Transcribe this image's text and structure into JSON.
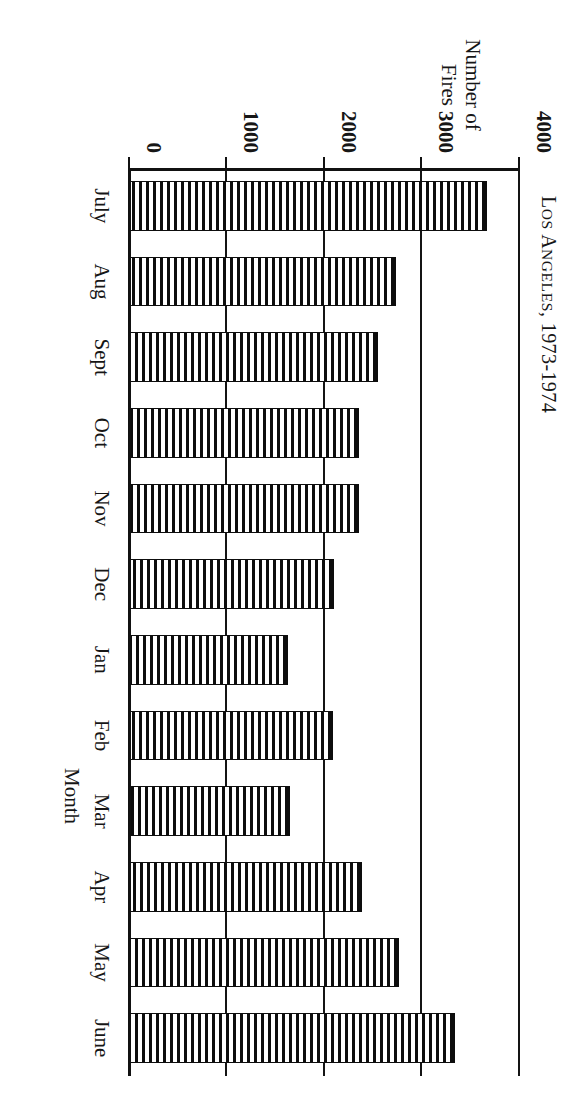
{
  "chart_data": {
    "type": "bar",
    "title": "Los Angeles, 1973-1974",
    "title_main": "L",
    "title_rest": "OS ",
    "orientation": "vertical-bars-on-rotated-page",
    "categories": [
      "July",
      "Aug",
      "Sept",
      "Oct",
      "Nov",
      "Dec",
      "Jan",
      "Feb",
      "Mar",
      "Apr",
      "May",
      "June"
    ],
    "values": [
      3680,
      2750,
      2560,
      2370,
      2370,
      2110,
      1640,
      2100,
      1660,
      2400,
      2780,
      3350
    ],
    "xlabel": "Month",
    "ylabel": "Number of\nFires",
    "ylabel_line1": "Number of",
    "ylabel_line2": "Fires",
    "ylim": [
      0,
      4000
    ],
    "yticks": [
      0,
      1000,
      2000,
      3000,
      4000
    ],
    "ytick_labels": [
      "0",
      "1000",
      "2000",
      "3000",
      "4000"
    ],
    "grid": true,
    "legend": false,
    "bar_fill": "horizontal-hatch",
    "colors": {
      "ink": "#111111",
      "paper": "#ffffff"
    }
  },
  "title": {
    "cap": "L",
    "small_a": "OS ",
    "cap2": "A",
    "small_b": "NGELES",
    "tail": ", 1973-1974"
  }
}
